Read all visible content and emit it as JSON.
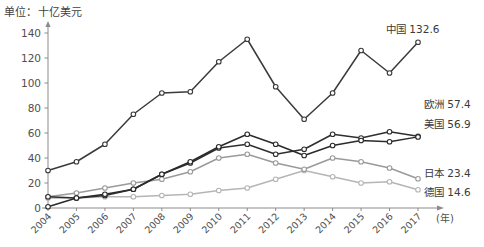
{
  "chart_data": {
    "type": "line",
    "title": "单位：十亿美元",
    "xlabel": "(年)",
    "ylabel": "",
    "unit_note": "单位：十亿美元",
    "x_axis_unit_label": "(年)",
    "categories": [
      "2004",
      "2005",
      "2006",
      "2007",
      "2008",
      "2009",
      "2010",
      "2011",
      "2012",
      "2013",
      "2014",
      "2015",
      "2016",
      "2017"
    ],
    "ylim": [
      0,
      140
    ],
    "yticks": [
      0,
      20,
      40,
      60,
      80,
      100,
      120,
      140
    ],
    "grid": false,
    "legend": "end-of-line labels",
    "series": [
      {
        "name": "中国",
        "end_label": "中国 132.6",
        "end_value": 132.6,
        "color": "#3a3a3a",
        "values": [
          30,
          37,
          51,
          75,
          92,
          93,
          117,
          135,
          97,
          71,
          92,
          126,
          108,
          132.6
        ]
      },
      {
        "name": "欧洲",
        "end_label": "欧洲 57.4",
        "end_value": 57.4,
        "color": "#2f2f2f",
        "values": [
          9,
          8,
          10,
          15,
          27,
          36,
          48,
          51,
          43,
          47,
          59,
          56,
          61,
          57.4
        ]
      },
      {
        "name": "美国",
        "end_label": "美国 56.9",
        "end_value": 56.9,
        "color": "#2b2b2b",
        "values": [
          1,
          8,
          11,
          15,
          27,
          37,
          49,
          59,
          51,
          42,
          50,
          54,
          53,
          56.9
        ]
      },
      {
        "name": "日本",
        "end_label": "日本 23.4",
        "end_value": 23.4,
        "color": "#9a9a9a",
        "values": [
          9,
          12,
          16,
          20,
          23,
          29,
          40,
          43,
          36,
          31,
          40,
          37,
          32,
          23.4
        ]
      },
      {
        "name": "德国",
        "end_label": "德国 14.6",
        "end_value": 14.6,
        "color": "#b5b5b5",
        "values": [
          8,
          8,
          9,
          9,
          10,
          11,
          14,
          16,
          23,
          30,
          25,
          20,
          21,
          14.6
        ]
      }
    ]
  }
}
